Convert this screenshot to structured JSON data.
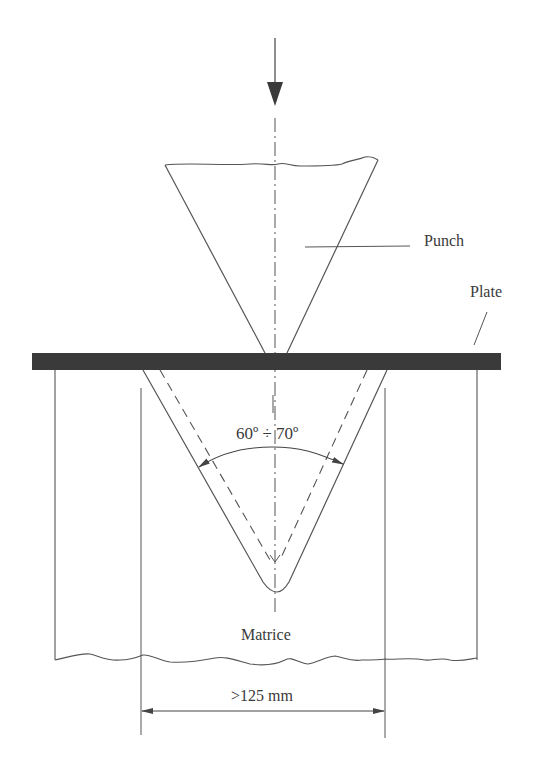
{
  "diagram": {
    "type": "V-die bending / press brake setup",
    "labels": {
      "punch": "Punch",
      "plate": "Plate",
      "angle": "60º ÷ 70º",
      "die": "Matrice",
      "width_dimension": ">125 mm"
    },
    "components": [
      "force-arrow",
      "center-axis",
      "punch",
      "plate",
      "die (matrice)",
      "angle-dimension",
      "width-dimension"
    ],
    "colors": {
      "line": "#4a4a4a",
      "plate_fill": "#3a3a3a",
      "text": "#3a3a3a",
      "background": "#ffffff"
    }
  }
}
